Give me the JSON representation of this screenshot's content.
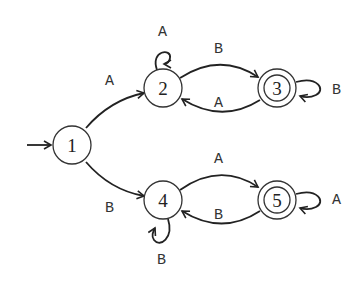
{
  "diagram": {
    "type": "finite-state-automaton",
    "states": [
      {
        "id": "1",
        "label": "1",
        "start": true,
        "accepting": false
      },
      {
        "id": "2",
        "label": "2",
        "start": false,
        "accepting": false
      },
      {
        "id": "3",
        "label": "3",
        "start": false,
        "accepting": true
      },
      {
        "id": "4",
        "label": "4",
        "start": false,
        "accepting": false
      },
      {
        "id": "5",
        "label": "5",
        "start": false,
        "accepting": true
      }
    ],
    "transitions": [
      {
        "from": "1",
        "to": "2",
        "label": "A"
      },
      {
        "from": "1",
        "to": "4",
        "label": "B"
      },
      {
        "from": "2",
        "to": "2",
        "label": "A"
      },
      {
        "from": "2",
        "to": "3",
        "label": "B"
      },
      {
        "from": "3",
        "to": "2",
        "label": "A"
      },
      {
        "from": "3",
        "to": "3",
        "label": "B"
      },
      {
        "from": "4",
        "to": "4",
        "label": "B"
      },
      {
        "from": "4",
        "to": "5",
        "label": "A"
      },
      {
        "from": "5",
        "to": "4",
        "label": "B"
      },
      {
        "from": "5",
        "to": "5",
        "label": "A"
      }
    ]
  }
}
